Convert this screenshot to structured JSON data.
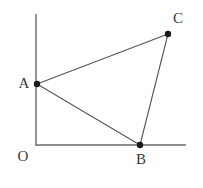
{
  "figure": {
    "type": "geometry-diagram",
    "background_color": "#ffffff",
    "line_color": "#555555",
    "axis_color": "#6a6a6a",
    "point_color": "#1a1a1a",
    "label_color": "#3a3a3a"
  },
  "axes": {
    "origin_label": "O",
    "vertical": {
      "x": 36,
      "y_top": 14,
      "y_bottom": 146
    },
    "horizontal": {
      "y": 145,
      "x_left": 36,
      "x_right": 186
    }
  },
  "points": [
    {
      "id": "A",
      "label": "A",
      "x": 37,
      "y": 84,
      "label_x": 24,
      "label_y": 83,
      "on_axis": "y-axis"
    },
    {
      "id": "B",
      "label": "B",
      "x": 140,
      "y": 145,
      "label_x": 141,
      "label_y": 159,
      "on_axis": "x-axis"
    },
    {
      "id": "C",
      "label": "C",
      "x": 168,
      "y": 34,
      "label_x": 178,
      "label_y": 18,
      "on_axis": "none"
    }
  ],
  "origin": {
    "label": "O",
    "label_x": 23,
    "label_y": 156
  },
  "segments": [
    {
      "id": "AC",
      "from": "A",
      "to": "C"
    },
    {
      "id": "AB",
      "from": "A",
      "to": "B"
    },
    {
      "id": "BC",
      "from": "B",
      "to": "C"
    }
  ]
}
